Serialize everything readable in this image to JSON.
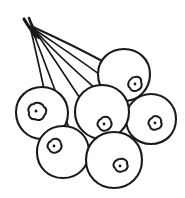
{
  "artwork": {
    "title": "Berry cluster line drawing",
    "subject": "berry-cluster",
    "style": "black and white outline sketch",
    "background_color": "#ffffff",
    "ink_color": "#1a1a1a",
    "canvas": {
      "width": 185,
      "height": 198
    },
    "berry_count": 6,
    "stem_count": 6,
    "stem_origin": {
      "x": 27,
      "y": 21
    }
  },
  "berries": [
    {
      "name": "berry-left",
      "label": "Left berry",
      "cx": 42,
      "cy": 113,
      "r": 26,
      "calyx": {
        "cx": 36,
        "cy": 111,
        "r": 8.5,
        "dot_r": 1.5
      },
      "stem_end": {
        "x": 44,
        "y": 88
      }
    },
    {
      "name": "berry-top-right",
      "label": "Top right berry",
      "cx": 124,
      "cy": 75,
      "r": 26,
      "calyx": {
        "cx": 135,
        "cy": 84,
        "r": 7.5,
        "dot_r": 1.4
      },
      "stem_end": {
        "x": 103,
        "y": 62
      }
    },
    {
      "name": "berry-center",
      "label": "Center berry",
      "cx": 102,
      "cy": 112,
      "r": 27,
      "calyx": {
        "cx": 104,
        "cy": 124,
        "r": 7.5,
        "dot_r": 1.4
      },
      "stem_end": {
        "x": 95,
        "y": 88
      }
    },
    {
      "name": "berry-right",
      "label": "Right berry",
      "cx": 151,
      "cy": 119,
      "r": 25,
      "calyx": {
        "cx": 155,
        "cy": 123,
        "r": 7,
        "dot_r": 1.4
      },
      "stem_end": {
        "x": 134,
        "y": 100
      }
    },
    {
      "name": "berry-bottom-left",
      "label": "Bottom left berry",
      "cx": 63,
      "cy": 152,
      "r": 26,
      "calyx": {
        "cx": 54,
        "cy": 146,
        "r": 7.5,
        "dot_r": 1.4
      },
      "stem_end": {
        "x": 69,
        "y": 127
      }
    },
    {
      "name": "berry-bottom-right",
      "label": "Bottom right berry",
      "cx": 114,
      "cy": 160,
      "r": 28,
      "calyx": {
        "cx": 120,
        "cy": 166,
        "r": 7.5,
        "dot_r": 1.4
      },
      "stem_end": {
        "x": 104,
        "y": 133
      }
    }
  ]
}
